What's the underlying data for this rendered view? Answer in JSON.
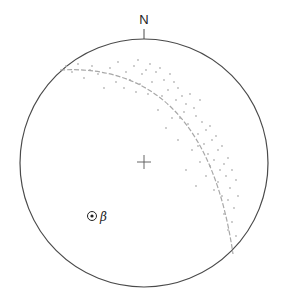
{
  "diagram": {
    "type": "stereonet",
    "north_label": "N",
    "beta_label": "β",
    "center": [
      144,
      163
    ],
    "radius": 124,
    "colors": {
      "primitive": "#4a4a4a",
      "great_circle": "#a8a8a8",
      "points": "#b8b8b8",
      "center_cross": "#555555",
      "beta": "#222222"
    },
    "great_circle": {
      "start": [
        60,
        70
      ],
      "end": [
        233,
        254
      ],
      "control": [
        205,
        62
      ],
      "style": "dashed"
    },
    "beta_point": {
      "x": 92,
      "y": 216
    },
    "poles": [
      [
        66,
        66
      ],
      [
        78,
        64
      ],
      [
        92,
        66
      ],
      [
        98,
        74
      ],
      [
        84,
        78
      ],
      [
        110,
        68
      ],
      [
        118,
        62
      ],
      [
        126,
        72
      ],
      [
        134,
        66
      ],
      [
        138,
        60
      ],
      [
        142,
        74
      ],
      [
        146,
        70
      ],
      [
        150,
        64
      ],
      [
        156,
        72
      ],
      [
        160,
        68
      ],
      [
        164,
        80
      ],
      [
        152,
        82
      ],
      [
        140,
        84
      ],
      [
        130,
        80
      ],
      [
        124,
        88
      ],
      [
        170,
        74
      ],
      [
        174,
        82
      ],
      [
        168,
        90
      ],
      [
        178,
        88
      ],
      [
        182,
        96
      ],
      [
        176,
        100
      ],
      [
        186,
        104
      ],
      [
        190,
        94
      ],
      [
        194,
        108
      ],
      [
        184,
        112
      ],
      [
        196,
        116
      ],
      [
        200,
        100
      ],
      [
        202,
        122
      ],
      [
        188,
        124
      ],
      [
        180,
        118
      ],
      [
        206,
        130
      ],
      [
        198,
        134
      ],
      [
        210,
        126
      ],
      [
        212,
        140
      ],
      [
        204,
        144
      ],
      [
        216,
        136
      ],
      [
        218,
        150
      ],
      [
        208,
        154
      ],
      [
        214,
        160
      ],
      [
        222,
        146
      ],
      [
        224,
        164
      ],
      [
        220,
        170
      ],
      [
        228,
        158
      ],
      [
        210,
        166
      ],
      [
        226,
        176
      ],
      [
        232,
        170
      ],
      [
        218,
        182
      ],
      [
        230,
        188
      ],
      [
        222,
        196
      ],
      [
        236,
        180
      ],
      [
        228,
        200
      ],
      [
        234,
        208
      ],
      [
        224,
        214
      ],
      [
        238,
        196
      ],
      [
        232,
        222
      ],
      [
        228,
        230
      ],
      [
        236,
        236
      ],
      [
        172,
        118
      ],
      [
        166,
        128
      ],
      [
        158,
        110
      ],
      [
        192,
        150
      ],
      [
        200,
        162
      ],
      [
        186,
        170
      ],
      [
        206,
        176
      ],
      [
        214,
        190
      ],
      [
        196,
        186
      ],
      [
        178,
        140
      ],
      [
        162,
        96
      ],
      [
        148,
        94
      ],
      [
        116,
        82
      ],
      [
        104,
        88
      ],
      [
        90,
        70
      ],
      [
        72,
        72
      ],
      [
        136,
        92
      ],
      [
        198,
        146
      ]
    ]
  }
}
